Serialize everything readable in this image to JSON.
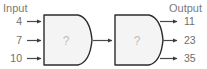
{
  "diagram": {
    "type": "function-machine",
    "headers": {
      "input": "Input",
      "output": "Output"
    },
    "input_values": [
      "4",
      "7",
      "10"
    ],
    "output_values": [
      "11",
      "23",
      "35"
    ],
    "machines": [
      {
        "label": "?"
      },
      {
        "label": "?"
      }
    ],
    "colors": {
      "machine_fill": "#f4f4f4",
      "machine_stroke": "#2b2b2b",
      "arrow": "#4a4a4a",
      "header_text": "#7b7b7b",
      "value_text": "#6e6e6e",
      "question_text": "#bdbdbd",
      "background": "#ffffff"
    }
  }
}
